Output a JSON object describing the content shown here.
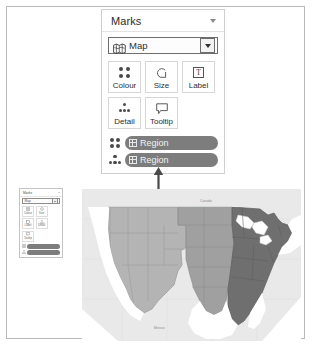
{
  "app": {
    "window_border_color": "#b9b9b9",
    "background": "#ffffff"
  },
  "marks_card": {
    "header": {
      "title": "Marks",
      "collapse_icon": "chevron-down-icon"
    },
    "mark_type_dropdown": {
      "icon": "map-icon",
      "value": "Map",
      "caret_icon": "caret-down-icon"
    },
    "shelf_buttons": [
      {
        "label": "Colour",
        "icon": "colour-dots-icon"
      },
      {
        "label": "Size",
        "icon": "size-spiral-icon"
      },
      {
        "label": "Label",
        "icon": "label-text-icon",
        "glyph": "T"
      },
      {
        "label": "Detail",
        "icon": "detail-dots-icon"
      },
      {
        "label": "Tooltip",
        "icon": "tooltip-bubble-icon"
      }
    ],
    "pills": [
      {
        "shelf_icon": "colour-dots-icon",
        "field_icon": "grid-dimension-icon",
        "field": "Region"
      },
      {
        "shelf_icon": "detail-dots-icon",
        "field_icon": "grid-dimension-icon",
        "field": "Region"
      }
    ],
    "pill_color": "#7d7d7d"
  },
  "annotation": {
    "arrow_icon": "arrow-up-icon",
    "arrow_color": "#4a4a4a",
    "points_to": "Region"
  },
  "mini_marks_card": {
    "header": {
      "title": "Marks",
      "collapse_icon": "chevron-down-icon"
    },
    "mark_type_dropdown": {
      "value": "Map",
      "caret_icon": "caret-down-icon"
    },
    "shelf_buttons": [
      {
        "label": "Colour"
      },
      {
        "label": "Size"
      },
      {
        "label": "Label"
      },
      {
        "label": "Detail"
      },
      {
        "label": "Tooltip"
      }
    ],
    "pills": [
      {
        "field": "Region"
      },
      {
        "field": "Region"
      }
    ]
  },
  "map": {
    "title": "",
    "background_color": "#e9e9e9",
    "water_color": "#ffffff",
    "border_color": "#9a9a9a",
    "legend_note": "Regions shaded by Region dimension",
    "regions": [
      {
        "name": "West",
        "color": "#b4b4b4"
      },
      {
        "name": "Central",
        "color": "#a0a0a0"
      },
      {
        "name": "East",
        "color": "#6f6f6f"
      }
    ],
    "labels": [
      {
        "text": "Canada",
        "x": 118,
        "y": 14
      },
      {
        "text": "Mexico",
        "x": 72,
        "y": 141
      }
    ]
  }
}
